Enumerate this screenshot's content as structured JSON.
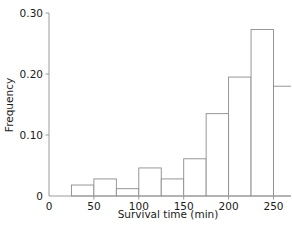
{
  "chart_data": {
    "type": "bar",
    "title": "",
    "subtitle": "",
    "xlabel": "Survival time (min)",
    "ylabel": "Frequency",
    "grid": false,
    "legend": null,
    "xlim": [
      0,
      325
    ],
    "ylim": [
      0,
      0.3
    ],
    "xticks": [
      0,
      50,
      100,
      150,
      200,
      250,
      300
    ],
    "xtick_labels": [
      "0",
      "50",
      "100",
      "150",
      "200",
      "250",
      "300"
    ],
    "yticks": [
      0,
      0.1,
      0.2,
      0.3
    ],
    "ytick_labels": [
      "0",
      "0.10",
      "0.20",
      "0.30"
    ],
    "bin_width": 25,
    "bin_edges": [
      25,
      50,
      75,
      100,
      125,
      150,
      175,
      200,
      225,
      250,
      275,
      300,
      325
    ],
    "categories": [
      "25-50",
      "50-75",
      "75-100",
      "100-125",
      "125-150",
      "150-175",
      "175-200",
      "200-225",
      "225-250",
      "250-275",
      "275-300",
      "300-325"
    ],
    "values": [
      0.018,
      0.028,
      0.012,
      0.046,
      0.028,
      0.061,
      0.135,
      0.195,
      0.273,
      0.18,
      0.034,
      0.022
    ],
    "bar_fill": "#ffffff",
    "bar_stroke": "#8c8c8c",
    "axis_color": "#9a9a9a",
    "text_color": "#1a1a1a"
  },
  "axes": {
    "y_title": "Frequency",
    "x_title": "Survival time (min)"
  }
}
